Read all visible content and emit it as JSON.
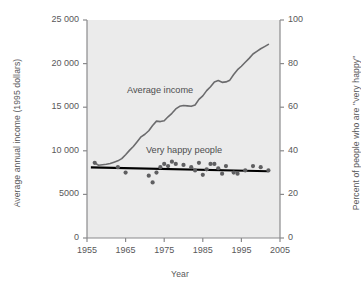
{
  "chart_data": {
    "type": "line",
    "title": "",
    "xlabel": "Year",
    "ylabel": "Average annual income (1995 dollars)",
    "ylabel_right": "Percent of people who are \"very happy\"",
    "xlim": [
      1955,
      2005
    ],
    "ylim": [
      0,
      25000
    ],
    "ylim_right": [
      0,
      100
    ],
    "xticks": [
      1955,
      1965,
      1975,
      1985,
      1995,
      2005
    ],
    "xticklabels": [
      "1955",
      "1965",
      "1975",
      "1985",
      "1995",
      "2005"
    ],
    "yticks": [
      0,
      5000,
      10000,
      15000,
      20000,
      25000
    ],
    "yticklabels": [
      "0",
      "5000",
      "10 000",
      "15 000",
      "20 000",
      "25 000"
    ],
    "yticks_right": [
      0,
      20,
      40,
      60,
      80,
      100
    ],
    "yticklabels_right": [
      "0",
      "20",
      "40",
      "60",
      "80",
      "100"
    ],
    "grid": false,
    "legend_position": "inline-annotations",
    "annotations": [
      {
        "text": "Average income",
        "x": 1974,
        "y": 16300
      },
      {
        "text": "Very happy people",
        "x": 1980,
        "y": 9600
      }
    ],
    "series": [
      {
        "name": "Average income",
        "type": "line",
        "axis": "left",
        "color": "#6b6b6d",
        "x": [
          1957,
          1958,
          1959,
          1960,
          1961,
          1962,
          1963,
          1964,
          1965,
          1966,
          1967,
          1968,
          1969,
          1970,
          1971,
          1972,
          1973,
          1974,
          1975,
          1976,
          1977,
          1978,
          1979,
          1980,
          1981,
          1982,
          1983,
          1984,
          1985,
          1986,
          1987,
          1988,
          1989,
          1990,
          1991,
          1992,
          1993,
          1994,
          1995,
          1996,
          1997,
          1998,
          1999,
          2000,
          2001,
          2002
        ],
        "y": [
          8600,
          8350,
          8400,
          8450,
          8550,
          8700,
          8850,
          9100,
          9550,
          10050,
          10500,
          11050,
          11600,
          11900,
          12300,
          12900,
          13400,
          13350,
          13450,
          13900,
          14300,
          14800,
          15100,
          15200,
          15150,
          15100,
          15250,
          15900,
          16300,
          16900,
          17350,
          17900,
          18050,
          17850,
          17900,
          18100,
          18750,
          19300,
          19700,
          20150,
          20600,
          21100,
          21400,
          21700,
          21950,
          22200
        ]
      },
      {
        "name": "Very happy people",
        "type": "scatter",
        "axis": "right",
        "color": "#5f5f61",
        "x": [
          1957,
          1963,
          1965,
          1971,
          1972,
          1973,
          1974,
          1975,
          1976,
          1977,
          1978,
          1980,
          1982,
          1983,
          1984,
          1985,
          1986,
          1987,
          1988,
          1989,
          1990,
          1991,
          1993,
          1994,
          1996,
          1998,
          2000,
          2002
        ],
        "y": [
          34.5,
          32.5,
          30.0,
          28.6,
          25.5,
          30.0,
          32.5,
          34.0,
          33.0,
          35.0,
          34.0,
          33.5,
          32.5,
          31.0,
          34.5,
          29.0,
          31.5,
          34.0,
          34.0,
          32.0,
          29.5,
          33.0,
          30.0,
          29.5,
          31.0,
          33.0,
          32.5,
          31.0
        ]
      },
      {
        "name": "Very happy people trend",
        "type": "trendline",
        "axis": "right",
        "color": "#000000",
        "x": [
          1956,
          2002
        ],
        "y": [
          32.4,
          30.6
        ]
      }
    ]
  },
  "figure": {
    "plot_background": "#ebebeb",
    "axis_color": "#8a8a8c",
    "text_color": "#58585a"
  }
}
